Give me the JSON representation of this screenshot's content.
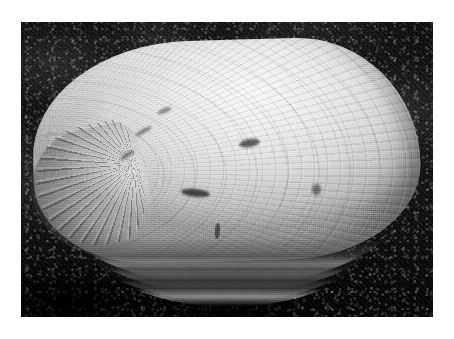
{
  "page": {
    "background_color": "#ffffff",
    "width": 454,
    "height": 339
  },
  "photo": {
    "caption": "",
    "alt_text": "Grayscale photograph of a bivalve clam shell resting on a dark textured fabric surface",
    "frame": {
      "left": 21,
      "top": 22,
      "width": 412,
      "height": 295
    },
    "rendering": "grayscale",
    "colors": {
      "page_background": "#ffffff",
      "photo_background_dark": "#141414",
      "photo_background_darkest": "#030303",
      "shell_highlight": "#f2f2f0",
      "shell_midtone": "#d5d5d1",
      "shell_shadow": "#9e9e99",
      "shell_margin_shadow": "#1a1a19"
    },
    "subject": {
      "name": "clam-shell",
      "type": "bivalve mollusc shell",
      "orientation": "umbo at left, ventral margin at bottom",
      "features": [
        "concentric growth rings",
        "radiating striations near umbo",
        "stacked layered ventral margin ridges",
        "dark surface blemishes"
      ]
    },
    "background": {
      "name": "dark-textured-fabric",
      "description": "dark, coarse, speckled carpet-like surface"
    }
  }
}
